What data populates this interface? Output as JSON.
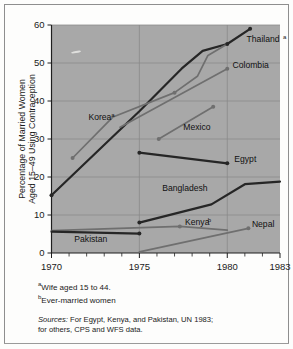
{
  "chart_data": {
    "type": "line",
    "title": "",
    "xlabel": "",
    "ylabel": "Percentage of Married Women Aged 15-49 Using Contraception",
    "ylabel_line1": "Percentage of Married Women",
    "ylabel_line2": "Aged 15–49 Using Contraception",
    "xlim": [
      1970,
      1983
    ],
    "ylim": [
      0,
      60
    ],
    "yticks": [
      0,
      10,
      20,
      30,
      40,
      50,
      60
    ],
    "ytick_labels": [
      "0",
      "10",
      "20",
      "30",
      "40",
      "50",
      "60"
    ],
    "xticks": [
      1970,
      1975,
      1980,
      1983
    ],
    "xtick_labels": [
      "1970",
      "1975",
      "1980",
      "1983"
    ],
    "grid": true,
    "legend": "inline-labels",
    "series": [
      {
        "name": "Thailand",
        "label": "Thailand",
        "superscript": "a",
        "color": "#262626",
        "width": 2.2,
        "points": [
          [
            1970,
            15.2
          ],
          [
            1975,
            37.3
          ],
          [
            1977.4,
            48.5
          ],
          [
            1978.6,
            53.2
          ],
          [
            1980,
            55.0
          ],
          [
            1981.3,
            59.0
          ]
        ],
        "markers": [
          [
            1970,
            15.2
          ],
          [
            1980,
            55.0
          ],
          [
            1981.3,
            59.0
          ]
        ],
        "label_x": 1981.1,
        "label_y": 55.4
      },
      {
        "name": "Korea",
        "label": "Korea",
        "superscript": "a",
        "color": "#6f6f6f",
        "width": 1.7,
        "points": [
          [
            1971.2,
            25.0
          ],
          [
            1973.5,
            35.8
          ],
          [
            1977.0,
            42.2
          ],
          [
            1978.3,
            46.5
          ],
          [
            1978.9,
            52.0
          ],
          [
            1980,
            55.0
          ]
        ],
        "markers": [
          [
            1971.2,
            25.0
          ],
          [
            1977.0,
            42.2
          ]
        ],
        "label_x": 1972.1,
        "label_y": 34.9
      },
      {
        "name": "Colombia",
        "label": "Colombia",
        "superscript": "",
        "color": "#6f6f6f",
        "width": 1.7,
        "points": [
          [
            1973.9,
            33.1
          ],
          [
            1980,
            48.5
          ]
        ],
        "markers": [
          [
            1980,
            48.5
          ]
        ],
        "label_x": 1980.3,
        "label_y": 48.8
      },
      {
        "name": "Mexico",
        "label": "Mexico",
        "superscript": "",
        "color": "#6f6f6f",
        "width": 1.7,
        "points": [
          [
            1976.1,
            30.0
          ],
          [
            1979.2,
            38.5
          ]
        ],
        "markers": [
          [
            1976.1,
            30.0
          ],
          [
            1979.2,
            38.5
          ]
        ],
        "label_x": 1977.5,
        "label_y": 32.5
      },
      {
        "name": "Egypt",
        "label": "Egypt",
        "superscript": "",
        "color": "#262626",
        "width": 2.2,
        "points": [
          [
            1975,
            26.4
          ],
          [
            1980,
            23.6
          ]
        ],
        "markers": [
          [
            1975,
            26.4
          ],
          [
            1980,
            23.6
          ]
        ],
        "label_x": 1980.4,
        "label_y": 24.0
      },
      {
        "name": "Bangladesh",
        "label": "Bangladesh",
        "superscript": "",
        "color": "#262626",
        "width": 2.2,
        "points": [
          [
            1975,
            8.0
          ],
          [
            1979.1,
            12.8
          ],
          [
            1981.0,
            18.1
          ],
          [
            1983,
            18.8
          ]
        ],
        "markers": [
          [
            1975,
            8.0
          ]
        ],
        "label_x": 1976.3,
        "label_y": 16.3
      },
      {
        "name": "Kenya",
        "label": "Kenya",
        "superscript": "b",
        "color": "#6f6f6f",
        "width": 1.7,
        "points": [
          [
            1970,
            5.9
          ],
          [
            1977.3,
            7.0
          ],
          [
            1980,
            6.0
          ]
        ],
        "markers": [
          [
            1977.3,
            7.0
          ]
        ],
        "label_x": 1977.6,
        "label_y": 7.3
      },
      {
        "name": "Nepal",
        "label": "Nepal",
        "superscript": "",
        "color": "#6f6f6f",
        "width": 1.7,
        "points": [
          [
            1975,
            0.3
          ],
          [
            1981.2,
            6.5
          ]
        ],
        "markers": [
          [
            1981.2,
            6.5
          ]
        ],
        "label_x": 1981.4,
        "label_y": 6.8
      },
      {
        "name": "Pakistan",
        "label": "Pakistan",
        "superscript": "",
        "color": "#262626",
        "width": 2.2,
        "points": [
          [
            1970,
            5.6
          ],
          [
            1975,
            5.1
          ]
        ],
        "markers": [
          [
            1975,
            5.1
          ]
        ],
        "label_x": 1971.3,
        "label_y": 3.0
      }
    ]
  },
  "footnotes": [
    {
      "marker": "a",
      "text": "Wife aged 15 to 44."
    },
    {
      "marker": "b",
      "text": "Ever-married women"
    }
  ],
  "sources": {
    "label": "Sources:",
    "line1": "For Egypt, Kenya, and Pakistan, UN 1983;",
    "line2": "for others, CPS and WFS data."
  },
  "colors": {
    "plot_background": "#a8a8a8",
    "grid": "#8a8a8a",
    "axis": "#1f1f1f",
    "page_background": "#fdfdfc",
    "dark_series": "#262626",
    "light_series": "#6f6f6f"
  }
}
